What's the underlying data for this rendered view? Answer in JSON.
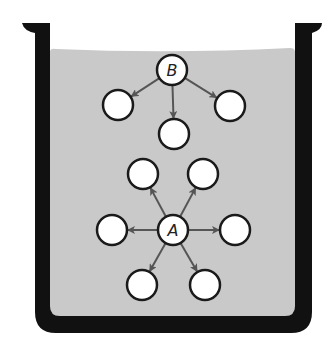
{
  "diagram": {
    "type": "beaker-particle-diagram",
    "colors": {
      "beaker_wall": "#111111",
      "liquid": "#c9c9c9",
      "particle_fill": "#ffffff",
      "particle_stroke": "#1a1a1a",
      "arrow": "#555555"
    },
    "nodes": {
      "B": {
        "label": "B",
        "cx": 172,
        "cy": 70
      },
      "B1": {
        "label": "",
        "cx": 118,
        "cy": 105
      },
      "B2": {
        "label": "",
        "cx": 174,
        "cy": 134
      },
      "B3": {
        "label": "",
        "cx": 230,
        "cy": 106
      },
      "A": {
        "label": "A",
        "cx": 173,
        "cy": 230
      },
      "A1": {
        "label": "",
        "cx": 143,
        "cy": 174
      },
      "A2": {
        "label": "",
        "cx": 203,
        "cy": 174
      },
      "A3": {
        "label": "",
        "cx": 112,
        "cy": 230
      },
      "A4": {
        "label": "",
        "cx": 235,
        "cy": 230
      },
      "A5": {
        "label": "",
        "cx": 142,
        "cy": 285
      },
      "A6": {
        "label": "",
        "cx": 205,
        "cy": 285
      }
    },
    "edges": [
      {
        "from": "B",
        "to": "B1"
      },
      {
        "from": "B",
        "to": "B2"
      },
      {
        "from": "B",
        "to": "B3"
      },
      {
        "from": "A",
        "to": "A1"
      },
      {
        "from": "A",
        "to": "A2"
      },
      {
        "from": "A",
        "to": "A3"
      },
      {
        "from": "A",
        "to": "A4"
      },
      {
        "from": "A",
        "to": "A5"
      },
      {
        "from": "A",
        "to": "A6"
      }
    ],
    "labels": {
      "B": "B",
      "A": "A"
    }
  }
}
